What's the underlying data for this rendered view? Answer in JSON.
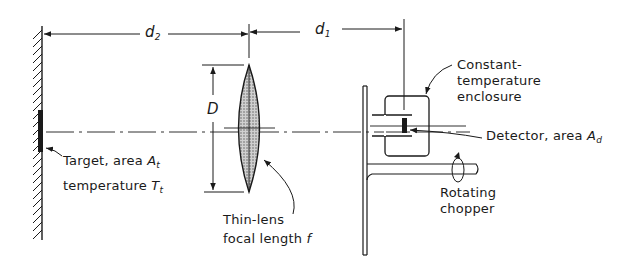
{
  "diagram": {
    "type": "optical-radiometer-setup",
    "dimensions": {
      "d2": {
        "symbol": "d",
        "subscript": "2"
      },
      "d1": {
        "symbol": "d",
        "subscript": "1"
      },
      "D": {
        "symbol": "D"
      }
    },
    "labels": {
      "enclosure": {
        "line1": "Constant-",
        "line2": "temperature",
        "line3": "enclosure"
      },
      "detector": {
        "text": "Detector, area ",
        "symbol": "A",
        "subscript": "d"
      },
      "target": {
        "line1_text": "Target, area ",
        "line1_symbol": "A",
        "line1_sub": "t",
        "line2_text": "temperature ",
        "line2_symbol": "T",
        "line2_sub": "t"
      },
      "lens": {
        "line1": "Thin-lens",
        "line2_text": "focal length ",
        "line2_symbol": "f"
      },
      "chopper": {
        "line1": "Rotating",
        "line2": "chopper"
      }
    },
    "colors": {
      "ink": "#1a1a1a",
      "background": "#ffffff",
      "lens_fill": "#b8b8b8"
    }
  }
}
